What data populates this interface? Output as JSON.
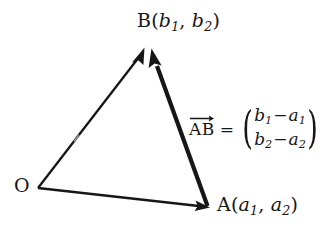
{
  "figure": {
    "kind": "vector-triangle-diagram",
    "background_color": "#ffffff",
    "ink_color": "#161616"
  },
  "points": {
    "origin": {
      "letter": "O",
      "x": 38,
      "y": 188
    },
    "a": {
      "letter": "A",
      "open_paren": "(",
      "var1": "a",
      "sub1": "1",
      "comma": ", ",
      "var2": "a",
      "sub2": "2",
      "close_paren": ")",
      "x": 208,
      "y": 207
    },
    "b": {
      "letter": "B",
      "open_paren": "(",
      "var1": "b",
      "sub1": "1",
      "comma": ", ",
      "var2": "b",
      "sub2": "2",
      "close_paren": ")",
      "x": 148,
      "y": 45
    }
  },
  "equation": {
    "vector_name": "AB",
    "equals": "=",
    "bracket_left": "(",
    "bracket_right": ")",
    "row1": {
      "term1": "b",
      "sub1": "1",
      "operator": "−",
      "term2": "a",
      "sub2": "1"
    },
    "row2": {
      "term1": "b",
      "sub1": "2",
      "operator": "−",
      "term2": "a",
      "sub2": "2"
    }
  },
  "edges": {
    "oa": {
      "label": "O to A",
      "from_x": 38,
      "from_y": 188,
      "to_x": 208,
      "to_y": 207,
      "stroke_width": 2.4,
      "arrowhead": true
    },
    "ob": {
      "label": "O to B",
      "from_x": 38,
      "from_y": 188,
      "to_x": 146,
      "to_y": 48,
      "stroke_width": 2.3,
      "arrowhead": true
    },
    "ab": {
      "label": "A to B",
      "from_x": 208,
      "from_y": 206,
      "to_x": 152,
      "to_y": 50,
      "stroke_width": 4.2,
      "arrowhead": true
    }
  }
}
